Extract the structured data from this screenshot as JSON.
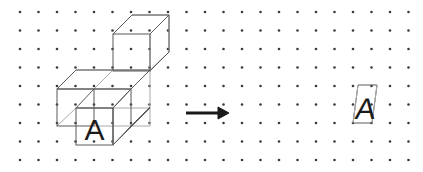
{
  "canvas": {
    "width": 423,
    "height": 172,
    "background": "#ffffff"
  },
  "grid": {
    "name": "isometric-dot-grid",
    "columns": 22,
    "rows": 9,
    "origin_x": 20,
    "origin_y": 12,
    "spacing_x": 18.5,
    "spacing_y": 18.5,
    "dot_radius": 1.3,
    "dot_color": "#3a3a3a"
  },
  "figures": {
    "left": {
      "name": "block-structure",
      "description": "L-shaped isometric block assembly drawn on dot grid",
      "label": "A",
      "label_font_size": 30,
      "edge_color_front": "#5a5a5a",
      "edge_color_hidden": "#aaaaaa",
      "front_faces": [
        {
          "name": "front-face-left",
          "x": 57,
          "y": 89,
          "w": 37,
          "h": 37
        },
        {
          "name": "front-face-lettered",
          "x": 76,
          "y": 108,
          "w": 37,
          "h": 37
        }
      ],
      "cube_top": {
        "name": "upper-cube",
        "x": 113,
        "y": 34,
        "w": 37,
        "h": 37
      }
    },
    "arrow": {
      "name": "transformation-arrow",
      "direction": "right",
      "x1": 186,
      "y1": 113,
      "x2": 226,
      "y2": 113,
      "color": "#1a1a1a",
      "stroke_width": 3
    },
    "right": {
      "name": "sheared-parallelogram",
      "description": "Skewed square containing a sheared letter A",
      "label": "A",
      "label_font_size": 30,
      "edge_color": "#5a5a5a",
      "points": "358,85 377,85 372,123 353,123",
      "shear_deg": -8
    }
  },
  "colors": {
    "dot": "#3a3a3a",
    "edge_dark": "#5a5a5a",
    "edge_light": "#aaaaaa",
    "glyph": "#1a1a1a",
    "arrow": "#1a1a1a",
    "background": "#ffffff"
  }
}
